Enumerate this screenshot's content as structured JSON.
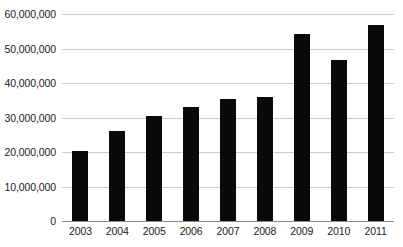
{
  "chart_data": {
    "type": "bar",
    "title": "",
    "subtitle": "",
    "xlabel": "",
    "ylabel": "",
    "categories": [
      "2003",
      "2004",
      "2005",
      "2006",
      "2007",
      "2008",
      "2009",
      "2010",
      "2011"
    ],
    "values": [
      20400000,
      26100000,
      30300000,
      33000000,
      35500000,
      36000000,
      54300000,
      46700000,
      56800000
    ],
    "series": [
      {
        "name": "",
        "values": [
          20400000,
          26100000,
          30300000,
          33000000,
          35500000,
          36000000,
          54300000,
          46700000,
          56800000
        ]
      }
    ],
    "ylim": [
      0,
      60000000
    ],
    "yticks": [
      0,
      10000000,
      20000000,
      30000000,
      40000000,
      50000000,
      60000000
    ],
    "ytick_labels": [
      "0",
      "10,000,000",
      "20,000,000",
      "30,000,000",
      "40,000,000",
      "50,000,000",
      "60,000,000"
    ],
    "xtick_labels": [
      "2003",
      "2004",
      "2005",
      "2006",
      "2007",
      "2008",
      "2009",
      "2010",
      "2011"
    ],
    "grid": true,
    "grid_axis": "y",
    "legend": false,
    "legend_position": "none",
    "bar_color": "#0a0a0a",
    "gridline_color": "#c9c9c9",
    "axis_color": "#8a8a8a",
    "background_color": "#ffffff",
    "text_color": "#1b1b1b",
    "annotations": []
  }
}
